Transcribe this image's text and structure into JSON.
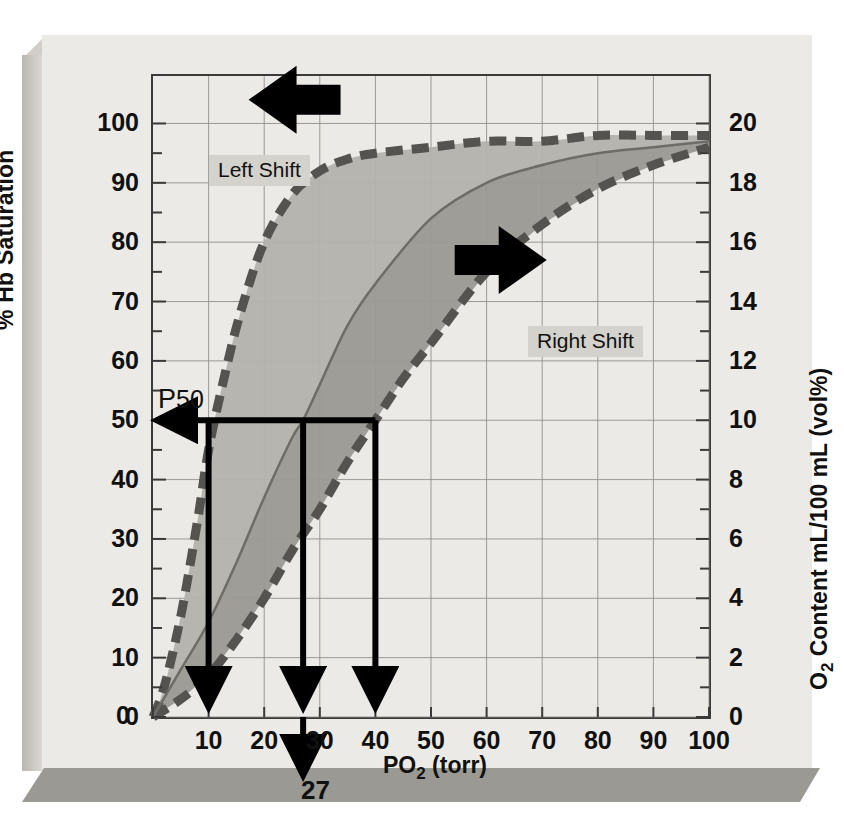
{
  "chart_data": {
    "type": "line",
    "title": "",
    "xlabel": "PO2 (torr)",
    "ylabel": "% Hb Saturation",
    "y2label": "O2 Content mL/100 mL (vol%)",
    "xlim": [
      0,
      100
    ],
    "ylim": [
      0,
      108
    ],
    "y2lim": [
      0,
      21.6
    ],
    "grid": true,
    "legend_position": "none",
    "xticks": [
      0,
      10,
      20,
      30,
      40,
      50,
      60,
      70,
      80,
      90,
      100
    ],
    "yticks": [
      0,
      10,
      20,
      30,
      40,
      50,
      60,
      70,
      80,
      90,
      100
    ],
    "y2ticks": [
      0,
      2,
      4,
      6,
      8,
      10,
      12,
      14,
      16,
      18,
      20
    ],
    "y_minor_step": 5,
    "series": [
      {
        "name": "Left Shift",
        "style": "dashed",
        "color": "#55534f",
        "x": [
          0,
          2,
          5,
          8,
          10,
          13,
          16,
          20,
          25,
          30,
          35,
          40,
          50,
          60,
          70,
          80,
          90,
          100
        ],
        "values": [
          0,
          5,
          17,
          33,
          45,
          58,
          69,
          80,
          88,
          92,
          94,
          95,
          96,
          97,
          97,
          98,
          98,
          98
        ]
      },
      {
        "name": "Normal",
        "style": "solid",
        "color": "#6e6c68",
        "x": [
          0,
          5,
          10,
          15,
          20,
          25,
          27,
          30,
          35,
          40,
          50,
          60,
          70,
          80,
          90,
          100
        ],
        "values": [
          0,
          8,
          16,
          26,
          37,
          47,
          50,
          56,
          66,
          73,
          84,
          90,
          93,
          95,
          96,
          97
        ]
      },
      {
        "name": "Right Shift",
        "style": "dashed",
        "color": "#55534f",
        "x": [
          0,
          5,
          10,
          15,
          20,
          25,
          30,
          35,
          40,
          45,
          50,
          60,
          70,
          80,
          90,
          100
        ],
        "values": [
          0,
          3,
          7,
          13,
          20,
          28,
          35,
          43,
          50,
          57,
          63,
          75,
          83,
          89,
          93,
          96
        ]
      }
    ],
    "annotations": {
      "p50_label": "P",
      "p50_sub": "50",
      "p50_saturation": 50,
      "p50_value": "27",
      "drop_lines": [
        {
          "x": 10,
          "y": 50,
          "curve": "Left Shift"
        },
        {
          "x": 27,
          "y": 50,
          "curve": "Normal"
        },
        {
          "x": 40,
          "y": 50,
          "curve": "Right Shift"
        }
      ],
      "left_shift_label": "Left Shift",
      "right_shift_label": "Right Shift",
      "left_arrow_icon": "arrow-left-icon",
      "right_arrow_icon": "arrow-right-icon"
    },
    "colors": {
      "page": "#eceae6",
      "frame": "#3a3a3a",
      "grid": "#8e8c88",
      "band_left": "#b4b2ad",
      "band_right": "#9b9994",
      "dashed_curve": "#55534f",
      "solid_curve": "#6e6c68",
      "annotation": "#000000",
      "highlight": "#d4d2cd"
    }
  },
  "axes": {
    "y_title": "% Hb Saturation",
    "x_title_main": "PO",
    "x_title_sub": "2",
    "x_title_unit": " (torr)",
    "y2_title_main": "O",
    "y2_title_sub": "2",
    "y2_title_rest": " Content mL/100 mL (vol%)"
  }
}
